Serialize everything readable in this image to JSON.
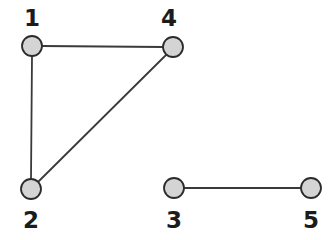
{
  "diagram": {
    "background_color": "#ffffff",
    "width": 335,
    "height": 240
  },
  "style": {
    "node_fill": "#d4d4d4",
    "node_stroke": "#2b2b2b",
    "node_stroke_width": 1.8,
    "node_radius": 10,
    "edge_color": "#3a3a3a",
    "edge_width": 1.8,
    "label_color": "#1c1c1c",
    "label_font_size": 23
  },
  "chart_data": {
    "type": "diagram",
    "graph_type": "undirected",
    "title": "",
    "node_count": 5,
    "edge_count": 4,
    "nodes": [
      {
        "id": "1",
        "label": "1",
        "x": 32,
        "y": 46,
        "label_x": 32,
        "label_y": 26,
        "label_position": "above"
      },
      {
        "id": "2",
        "label": "2",
        "x": 31,
        "y": 189,
        "label_x": 31,
        "label_y": 228,
        "label_position": "below"
      },
      {
        "id": "3",
        "label": "3",
        "x": 174,
        "y": 188,
        "label_x": 174,
        "label_y": 228,
        "label_position": "below"
      },
      {
        "id": "4",
        "label": "4",
        "x": 173,
        "y": 47,
        "label_x": 169,
        "label_y": 26,
        "label_position": "above"
      },
      {
        "id": "5",
        "label": "5",
        "x": 311,
        "y": 188,
        "label_x": 311,
        "label_y": 228,
        "label_position": "below"
      }
    ],
    "edges": [
      {
        "id": "edge-1-4",
        "source": "1",
        "target": "4",
        "x1": 42,
        "y1": 46,
        "x2": 163,
        "y2": 47
      },
      {
        "id": "edge-1-2",
        "source": "1",
        "target": "2",
        "x1": 32,
        "y1": 56,
        "x2": 31,
        "y2": 179
      },
      {
        "id": "edge-2-4",
        "source": "2",
        "target": "4",
        "x1": 38,
        "y1": 182,
        "x2": 166,
        "y2": 55
      },
      {
        "id": "edge-3-5",
        "source": "3",
        "target": "5",
        "x1": 184,
        "y1": 188,
        "x2": 301,
        "y2": 188
      }
    ],
    "components": [
      {
        "nodes": [
          "1",
          "2",
          "4"
        ]
      },
      {
        "nodes": [
          "3",
          "5"
        ]
      }
    ]
  }
}
